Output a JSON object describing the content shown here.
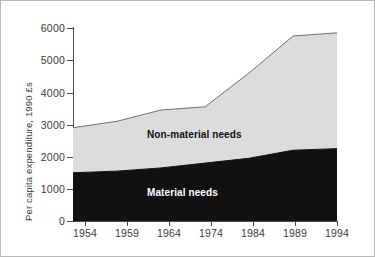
{
  "chart_data": {
    "type": "area",
    "title": "",
    "subtitle": "",
    "xlabel": "",
    "ylabel": "Per capita expenditure, 1990 £s",
    "categories": [
      "1954",
      "1959",
      "1964",
      "1974",
      "1984",
      "1989",
      "1994"
    ],
    "series": [
      {
        "name": "Material needs",
        "color": "#111111",
        "values": [
          1500,
          1550,
          1650,
          1800,
          1950,
          2200,
          2250
        ]
      },
      {
        "name": "Non-material needs",
        "color": "#dcdcdc",
        "values": [
          1400,
          1550,
          1800,
          1750,
          2650,
          3550,
          3600
        ]
      }
    ],
    "totals": [
      2900,
      3100,
      3450,
      3550,
      4600,
      5750,
      5850
    ],
    "ylim": [
      0,
      6000
    ],
    "yticks": [
      0,
      1000,
      2000,
      3000,
      4000,
      5000,
      6000
    ],
    "ytick_labels": [
      "0",
      "1000",
      "2000",
      "3000",
      "4000",
      "5000",
      "6000"
    ],
    "grid": false,
    "legend_position": "inline-annotations",
    "annotations": [
      {
        "text": "Non-material needs",
        "series": "Non-material needs"
      },
      {
        "text": "Material needs",
        "series": "Material needs"
      }
    ],
    "stacked": true
  },
  "axes": {
    "y_title": "Per capita expenditure, 1990 £s",
    "y_labels": [
      "6000",
      "5000",
      "4000",
      "3000",
      "2000",
      "1000",
      "0"
    ],
    "x_labels": [
      "1954",
      "1959",
      "1964",
      "1974",
      "1984",
      "1989",
      "1994"
    ]
  },
  "labels": {
    "non_material": "Non-material needs",
    "material": "Material needs"
  },
  "colors": {
    "material_fill": "#111111",
    "non_material_fill": "#dcdcdc",
    "axis": "#4a4a4a",
    "border": "#b9b9b9",
    "background": "#ffffff",
    "text": "#3a3a3a"
  }
}
